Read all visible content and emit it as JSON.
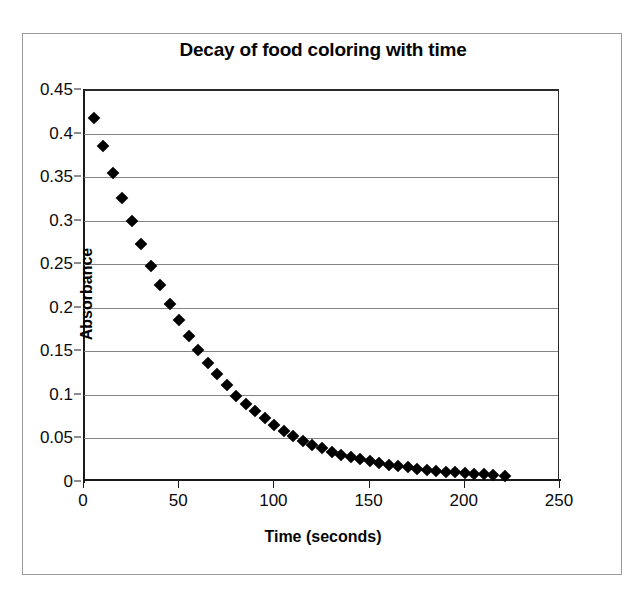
{
  "figure": {
    "title": "Decay of food coloring with time",
    "background": "#ffffff",
    "frame_color": "#9a9a9a"
  },
  "chart_data": {
    "type": "scatter",
    "title": "Decay of food coloring with time",
    "xlabel": "Time (seconds)",
    "ylabel": "Absorbance",
    "xlim": [
      0,
      250
    ],
    "ylim": [
      0,
      0.45
    ],
    "xticks": [
      0,
      50,
      100,
      150,
      200,
      250
    ],
    "yticks": [
      0,
      0.05,
      0.1,
      0.15,
      0.2,
      0.25,
      0.3,
      0.35,
      0.4,
      0.45
    ],
    "xtick_labels": [
      "0",
      "50",
      "100",
      "150",
      "200",
      "250"
    ],
    "ytick_labels": [
      "0",
      "0.05",
      "0.1",
      "0.15",
      "0.2",
      "0.25",
      "0.3",
      "0.35",
      "0.4",
      "0.45"
    ],
    "grid": "horizontal",
    "legend": "none",
    "marker": "diamond",
    "marker_color": "#000000",
    "series": [
      {
        "name": "Absorbance",
        "x": [
          5,
          10,
          15,
          20,
          25,
          30,
          35,
          40,
          45,
          50,
          55,
          60,
          65,
          70,
          75,
          80,
          85,
          90,
          95,
          100,
          105,
          110,
          115,
          120,
          125,
          130,
          135,
          140,
          145,
          150,
          155,
          160,
          165,
          170,
          175,
          180,
          185,
          190,
          195,
          200,
          205,
          210,
          215,
          221
        ],
        "y": [
          0.418,
          0.386,
          0.355,
          0.326,
          0.3,
          0.273,
          0.248,
          0.226,
          0.204,
          0.186,
          0.168,
          0.152,
          0.137,
          0.124,
          0.111,
          0.099,
          0.09,
          0.081,
          0.073,
          0.065,
          0.058,
          0.053,
          0.047,
          0.043,
          0.039,
          0.035,
          0.031,
          0.029,
          0.026,
          0.024,
          0.022,
          0.02,
          0.018,
          0.017,
          0.015,
          0.014,
          0.013,
          0.012,
          0.011,
          0.01,
          0.009,
          0.009,
          0.008,
          0.007
        ]
      }
    ]
  }
}
